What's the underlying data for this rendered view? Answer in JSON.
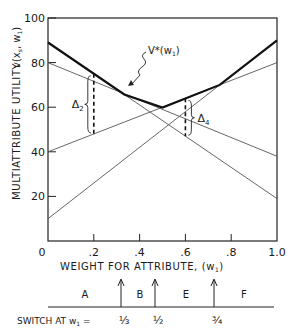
{
  "chart_data": {
    "type": "line",
    "title": "",
    "xlabel": "WEIGHT FOR ATTRIBUTE, (w1)",
    "ylabel": "MULTIATTRIBUTE UTILITY v(x_s, w1)",
    "xlim": [
      0,
      1.0
    ],
    "ylim": [
      0,
      100
    ],
    "grid": false,
    "x_ticks": [
      "0",
      ".2",
      ".4",
      ".6",
      ".8",
      "1.0"
    ],
    "y_ticks": [
      "20",
      "40",
      "60",
      "80",
      "100"
    ],
    "x": [
      0,
      1.0
    ],
    "series": [
      {
        "name": "A",
        "values": [
          89,
          19
        ]
      },
      {
        "name": "B",
        "values": [
          80,
          38
        ]
      },
      {
        "name": "E",
        "values": [
          40,
          80
        ]
      },
      {
        "name": "F",
        "values": [
          10,
          90
        ]
      }
    ],
    "envelope": {
      "name": "V*(w1)",
      "points": [
        [
          0,
          89
        ],
        [
          0.333,
          65.7
        ],
        [
          0.5,
          59.8
        ],
        [
          0.75,
          70
        ],
        [
          1.0,
          90
        ]
      ]
    },
    "annotations": [
      {
        "label": "V*(w1)",
        "x": 0.42,
        "y": 80
      },
      {
        "label": "Δ2",
        "x": 0.2,
        "y_top": 75,
        "y_bottom": 48
      },
      {
        "label": "Δ4",
        "x": 0.6,
        "y_top": 64,
        "y_bottom": 47
      }
    ],
    "switch_points": {
      "label": "SWITCH AT w1 =",
      "regions": [
        "A",
        "B",
        "E",
        "F"
      ],
      "values": [
        "1/3",
        "1/2",
        "3/4"
      ]
    }
  },
  "labels": {
    "y_axis_title": "MULTIATTRIBUTE  UTILITY",
    "y_axis_var": "v(x",
    "x_axis_title": "WEIGHT  FOR  ATTRIBUTE,  (w",
    "vstar": "V*(w",
    "delta2": "Δ",
    "delta4": "Δ",
    "switch_label": "SWITCH AT  w",
    "switch_eq": " ="
  }
}
